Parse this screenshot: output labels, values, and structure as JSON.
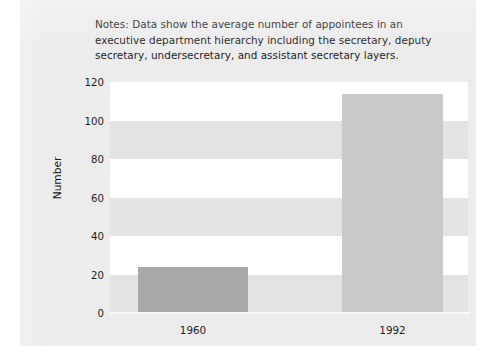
{
  "page": {
    "notes": "Notes: Data show the average number of appointees in an executive department hierarchy including the secretary, deputy secretary, undersecretary, and assistant secretary layers."
  },
  "chart_data": {
    "type": "bar",
    "title": "",
    "subtitle": "",
    "xlabel": "",
    "ylabel": "Number",
    "categories": [
      "1960",
      "1992"
    ],
    "values": [
      24,
      114
    ],
    "series": [
      {
        "name": "Appointees",
        "values": [
          24,
          114
        ]
      }
    ],
    "ylim": [
      0,
      120
    ],
    "yticks": [
      "0",
      "20",
      "40",
      "60",
      "80",
      "100",
      "120"
    ],
    "ytick_values": [
      0,
      20,
      40,
      60,
      80,
      100,
      120
    ],
    "grid": "horizontal-alternating-bands",
    "legend": "none",
    "bar_colors": [
      "#a9a9a9",
      "#c9c9c9"
    ],
    "band_colors": {
      "gray": "#e3e3e3",
      "white": "#ffffff"
    },
    "annotations": [
      "Notes: Data show the average number of appointees in an executive department hierarchy including the secretary, deputy secretary, undersecretary, and assistant secretary layers."
    ]
  }
}
